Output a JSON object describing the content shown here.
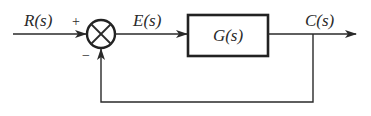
{
  "diagram": {
    "type": "negative feedback control loop block diagram",
    "input_signal": "R(s)",
    "error_signal": "E(s)",
    "output_signal": "C(s)",
    "block": {
      "label": "G(s)"
    },
    "summing_junction": {
      "plus_sign": "+",
      "minus_sign": "−"
    },
    "feedback": "unity negative feedback from C(s) to summing junction",
    "colors": {
      "stroke": "#2a2a2a",
      "background": "#ffffff"
    }
  }
}
